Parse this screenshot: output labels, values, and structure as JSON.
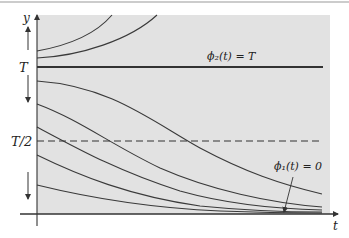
{
  "figure": {
    "axes": {
      "x_label": "t",
      "y_label": "y",
      "y_ticks": [
        {
          "label": "T",
          "value": 1.0
        },
        {
          "label": "T/2",
          "value": 0.5
        }
      ]
    },
    "annotations": {
      "phi2": "ϕ₂(t) = T",
      "phi1": "ϕ₁(t) = 0"
    },
    "lines": {
      "equilibrium_T": {
        "style": "solid",
        "y": "T"
      },
      "half_T": {
        "style": "dashed",
        "y": "T/2"
      },
      "equilibrium_zero": {
        "style": "solid",
        "y": "0"
      }
    },
    "curves_above_T": [
      {
        "start_y_fraction": 1.22
      },
      {
        "start_y_fraction": 1.12
      }
    ],
    "curves_below_T": [
      {
        "start_y_fraction": 0.9
      },
      {
        "start_y_fraction": 0.74
      },
      {
        "start_y_fraction": 0.59
      },
      {
        "start_y_fraction": 0.4
      },
      {
        "start_y_fraction": 0.2
      }
    ],
    "direction_arrows": [
      {
        "region": "above T",
        "direction": "up"
      },
      {
        "region": "between T/2 and T",
        "direction": "down"
      },
      {
        "region": "between 0 and T/2",
        "direction": "down"
      }
    ],
    "colors": {
      "plot_background": "#e2e2e2",
      "line": "#3a3a3a"
    }
  }
}
